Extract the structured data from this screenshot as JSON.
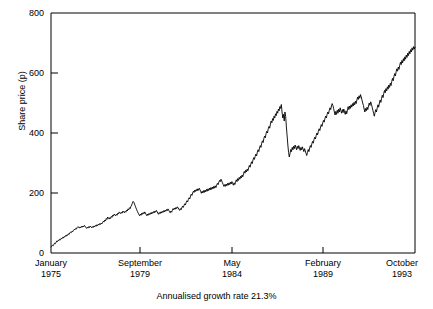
{
  "chart_data": {
    "type": "line",
    "title": "",
    "xlabel": "",
    "ylabel": "Share price (p)",
    "caption": "Annualised growth rate 21.3%",
    "ylim": [
      0,
      800
    ],
    "yticks": [
      0,
      200,
      400,
      600,
      800
    ],
    "ytick_labels": [
      "0",
      "200",
      "400",
      "600",
      "800"
    ],
    "xtick_labels": [
      {
        "month": "January",
        "year": "1975"
      },
      {
        "month": "September",
        "year": "1979"
      },
      {
        "month": "May",
        "year": "1984"
      },
      {
        "month": "February",
        "year": "1989"
      },
      {
        "month": "October",
        "year": "1993"
      }
    ],
    "grid": false,
    "legend": "none",
    "line_color": "#000000",
    "series": [
      {
        "name": "Share price",
        "values": [
          20,
          22,
          26,
          24,
          29,
          33,
          31,
          36,
          40,
          38,
          43,
          41,
          46,
          44,
          49,
          47,
          52,
          50,
          55,
          53,
          58,
          56,
          61,
          59,
          64,
          62,
          67,
          70,
          68,
          73,
          71,
          76,
          79,
          77,
          82,
          80,
          85,
          88,
          86,
          83,
          87,
          84,
          89,
          86,
          90,
          87,
          92,
          89,
          85,
          82,
          86,
          83,
          88,
          85,
          90,
          87,
          84,
          88,
          85,
          90,
          87,
          92,
          89,
          94,
          91,
          96,
          93,
          98,
          95,
          100,
          97,
          102,
          106,
          103,
          110,
          107,
          115,
          112,
          120,
          117,
          113,
          118,
          115,
          122,
          119,
          126,
          123,
          130,
          127,
          124,
          129,
          126,
          133,
          130,
          137,
          134,
          131,
          136,
          133,
          140,
          137,
          134,
          139,
          136,
          143,
          140,
          147,
          144,
          151,
          148,
          155,
          160,
          166,
          172,
          169,
          163,
          156,
          150,
          144,
          138,
          133,
          128,
          124,
          130,
          126,
          133,
          129,
          135,
          131,
          137,
          133,
          128,
          124,
          130,
          126,
          132,
          128,
          134,
          130,
          136,
          132,
          138,
          134,
          140,
          136,
          142,
          138,
          133,
          129,
          135,
          131,
          137,
          133,
          139,
          135,
          141,
          137,
          143,
          139,
          145,
          141,
          147,
          143,
          138,
          134,
          140,
          136,
          142,
          148,
          144,
          150,
          146,
          152,
          148,
          154,
          150,
          146,
          142,
          148,
          144,
          150,
          156,
          152,
          158,
          164,
          160,
          168,
          174,
          170,
          178,
          184,
          180,
          190,
          196,
          192,
          200,
          206,
          202,
          210,
          205,
          212,
          207,
          214,
          209,
          216,
          211,
          205,
          199,
          206,
          200,
          208,
          202,
          210,
          204,
          212,
          206,
          214,
          208,
          216,
          210,
          218,
          212,
          220,
          214,
          222,
          216,
          224,
          218,
          226,
          232,
          228,
          236,
          242,
          238,
          246,
          240,
          234,
          228,
          222,
          228,
          222,
          230,
          224,
          232,
          226,
          234,
          228,
          236,
          230,
          238,
          232,
          226,
          234,
          228,
          236,
          244,
          238,
          248,
          242,
          252,
          246,
          256,
          250,
          260,
          254,
          264,
          272,
          266,
          276,
          270,
          280,
          274,
          284,
          292,
          286,
          296,
          304,
          298,
          310,
          318,
          312,
          322,
          330,
          324,
          336,
          344,
          338,
          350,
          358,
          352,
          366,
          374,
          368,
          382,
          390,
          384,
          398,
          406,
          400,
          414,
          422,
          416,
          430,
          440,
          434,
          448,
          442,
          456,
          450,
          464,
          458,
          472,
          466,
          480,
          474,
          488,
          482,
          495,
          470,
          450,
          462,
          440,
          470,
          455,
          420,
          390,
          360,
          335,
          320,
          332,
          345,
          338,
          352,
          344,
          356,
          348,
          360,
          352,
          344,
          356,
          348,
          358,
          350,
          342,
          352,
          344,
          354,
          346,
          338,
          348,
          340,
          332,
          325,
          335,
          345,
          338,
          350,
          358,
          352,
          364,
          372,
          366,
          378,
          386,
          380,
          392,
          400,
          394,
          406,
          414,
          408,
          420,
          428,
          422,
          434,
          442,
          436,
          448,
          456,
          450,
          462,
          470,
          464,
          476,
          484,
          478,
          490,
          498,
          492,
          482,
          470,
          460,
          472,
          462,
          476,
          466,
          480,
          470,
          484,
          474,
          466,
          478,
          468,
          480,
          470,
          462,
          474,
          464,
          476,
          488,
          478,
          490,
          482,
          494,
          486,
          498,
          490,
          502,
          494,
          506,
          498,
          510,
          520,
          512,
          524,
          516,
          528,
          520,
          510,
          500,
          492,
          480,
          470,
          482,
          474,
          486,
          478,
          490,
          500,
          492,
          504,
          496,
          486,
          476,
          466,
          456,
          468,
          478,
          470,
          484,
          494,
          486,
          500,
          510,
          502,
          516,
          526,
          518,
          532,
          542,
          534,
          548,
          540,
          554,
          546,
          560,
          552,
          566,
          558,
          572,
          582,
          574,
          588,
          598,
          590,
          604,
          614,
          606,
          620,
          612,
          626,
          636,
          628,
          642,
          634,
          648,
          640,
          654,
          646,
          660,
          652,
          666,
          658,
          672,
          664,
          678,
          670,
          684,
          676,
          688,
          680,
          686
        ]
      }
    ]
  }
}
